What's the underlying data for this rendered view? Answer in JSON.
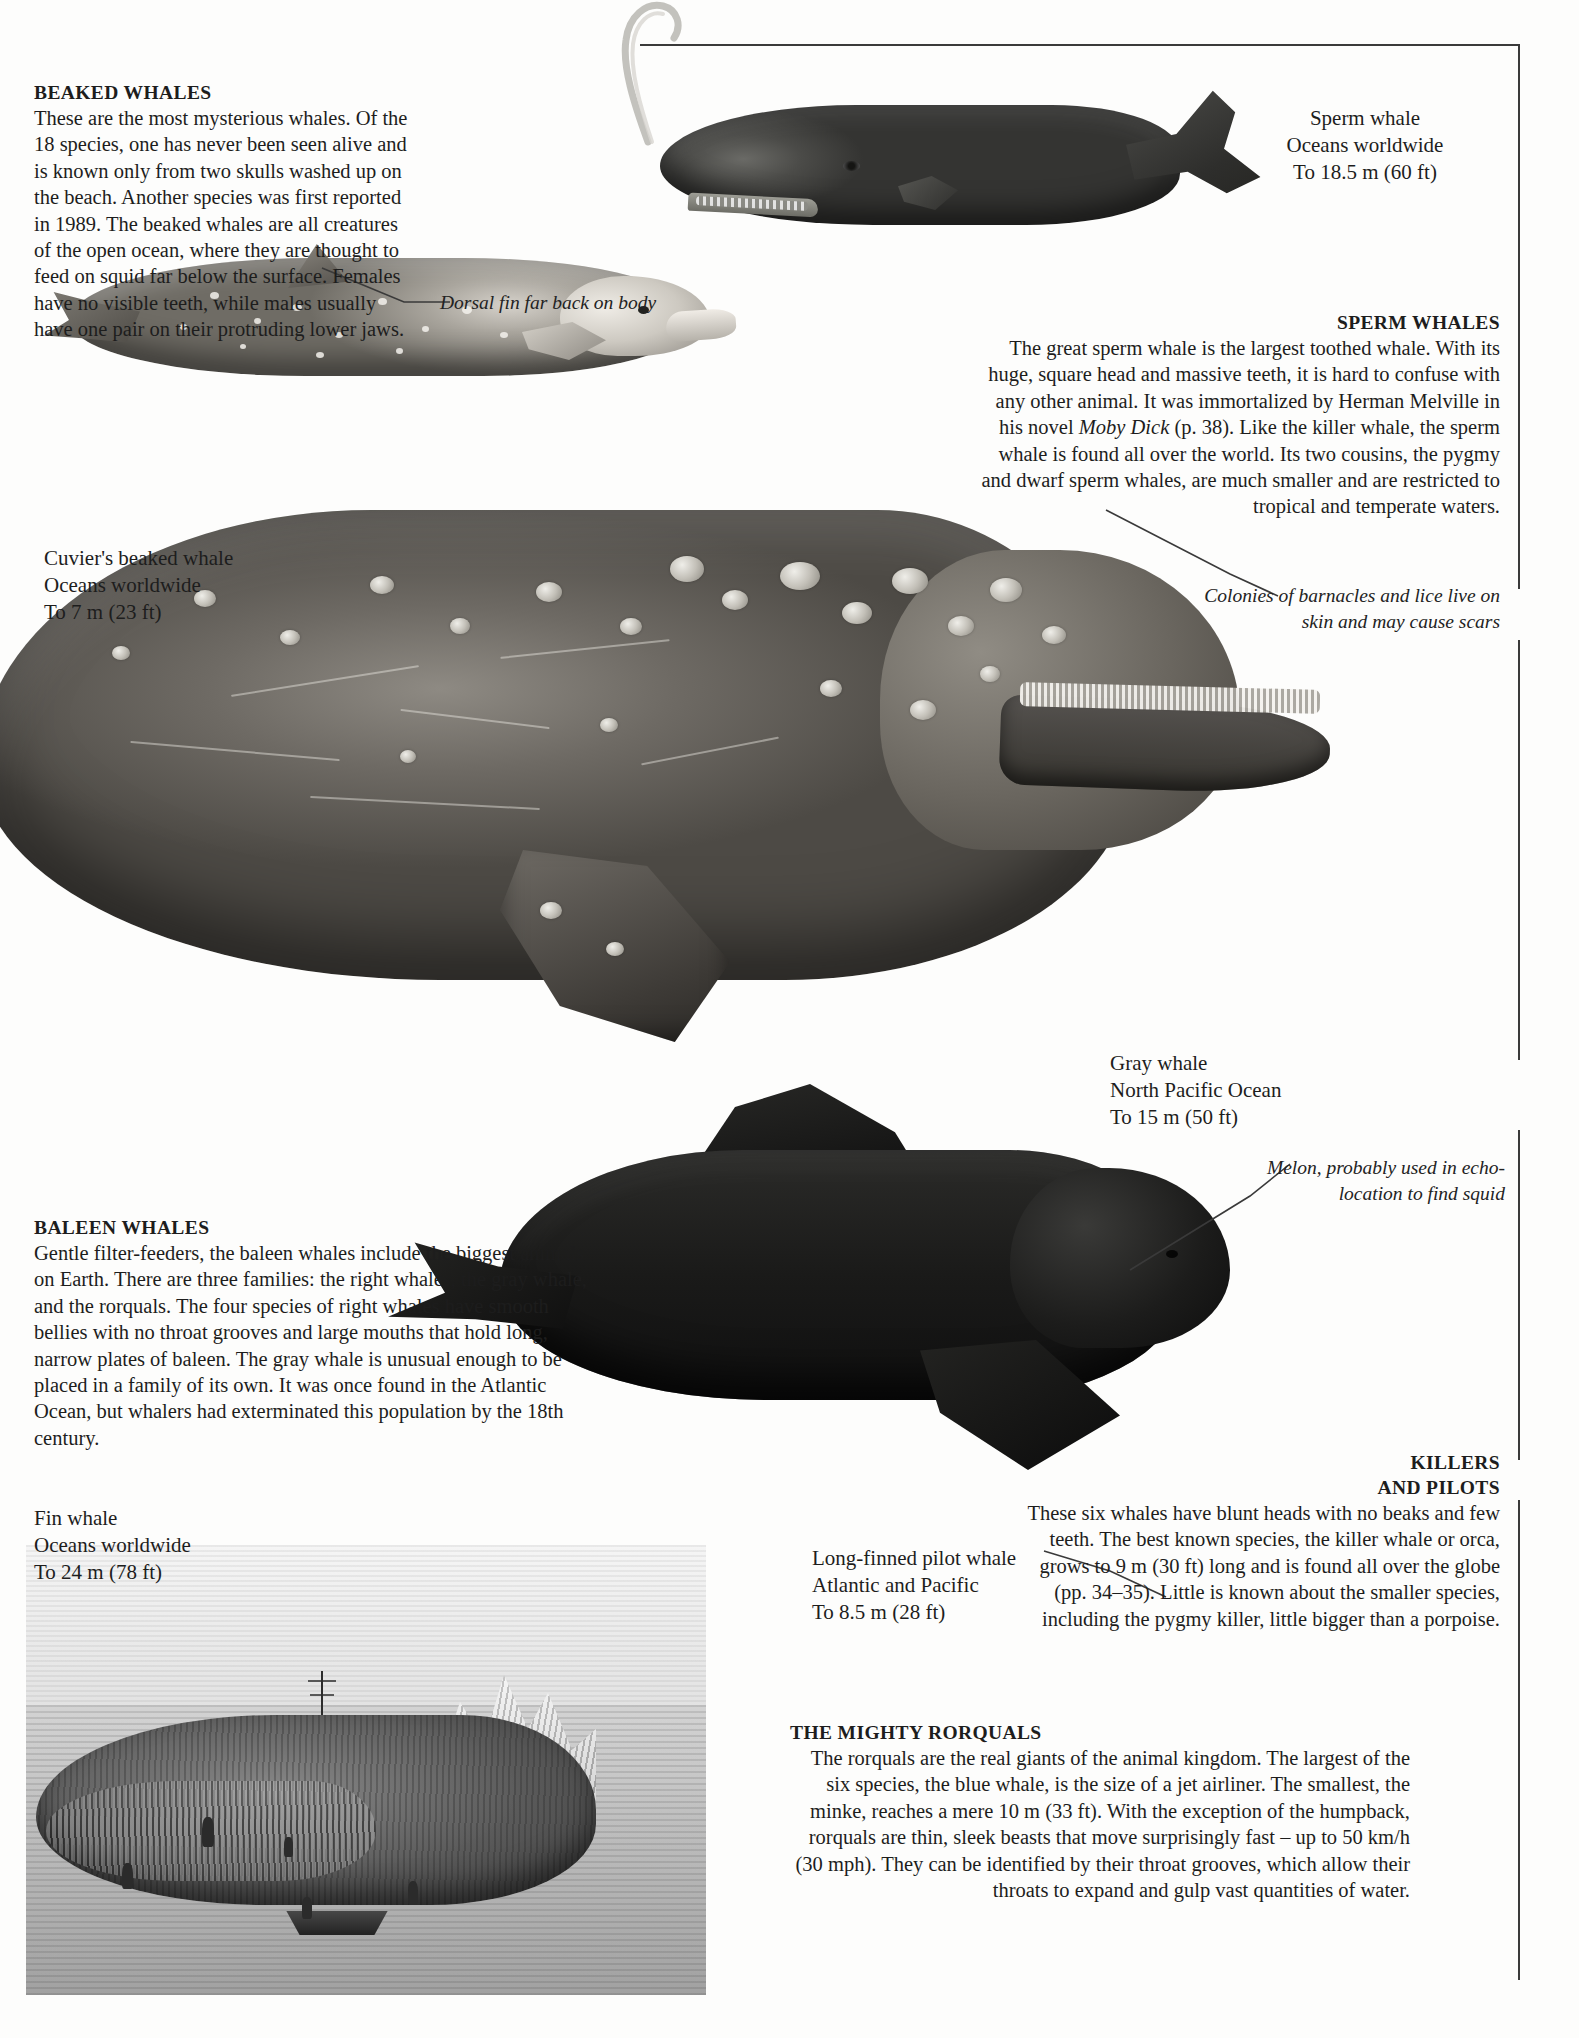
{
  "sections": {
    "beaked": {
      "heading": "BEAKED WHALES",
      "body": "These are the most mysterious whales. Of the 18 species, one has never been seen alive and is known only from two skulls washed up on the beach. Another species was first reported in 1989. The beaked whales are all creatures of the open ocean, where they are thought to feed on squid far below the surface. Females have no visible teeth, while males usually have one pair on their protruding lower jaws."
    },
    "sperm": {
      "heading": "SPERM WHALES",
      "body_1": "The great sperm whale is the largest toothed whale. With its huge, square head and massive teeth, it is hard to confuse with any other animal. It was immortalized by Herman Melville in his novel ",
      "book_title": "Moby Dick",
      "body_2": " (p. 38). Like the killer whale, the sperm whale is found all over the world. Its two cousins, the pygmy and dwarf sperm whales, are much smaller and are restricted to tropical and temperate waters."
    },
    "baleen": {
      "heading": "BALEEN WHALES",
      "body": "Gentle filter-feeders, the baleen whales include the biggest animals on Earth. There are three families: the right whales, the gray whale, and the rorquals. The four species of right whales have smooth bellies with no throat grooves and large mouths that hold long, narrow plates of baleen. The gray whale is unusual enough to be placed in a family of its own. It was once found in the Atlantic Ocean, but whalers had exterminated this population by the 18th century."
    },
    "killers": {
      "heading_line_1": "KILLERS",
      "heading_line_2": "AND PILOTS",
      "body": "These six whales have blunt heads with no beaks and few teeth. The best known species, the killer whale or orca, grows to 9 m (30 ft) long and is found all over the globe (pp. 34–35). Little is known about the smaller species, including the pygmy killer, little bigger than a porpoise."
    },
    "rorquals": {
      "heading": "THE MIGHTY RORQUALS",
      "body": "The rorquals are the real giants of the animal kingdom. The largest of the six species, the blue whale, is the size of a jet airliner. The smallest, the minke, reaches a mere 10 m (33 ft). With the exception of the humpback, rorquals are thin, sleek beasts that move surprisingly fast – up to 50 km/h (30 mph). They can be identified by their throat grooves, which allow their throats to expand and gulp vast quantities of water."
    }
  },
  "captions": {
    "sperm_whale": {
      "name": "Sperm whale",
      "range": "Oceans worldwide",
      "size": "To 18.5 m (60 ft)"
    },
    "cuviers_beaked_whale": {
      "name": "Cuvier's beaked whale",
      "range": "Oceans worldwide",
      "size": "To 7 m (23 ft)"
    },
    "gray_whale": {
      "name": "Gray whale",
      "range": "North Pacific Ocean",
      "size": "To 15 m (50 ft)"
    },
    "pilot_whale": {
      "name": "Long-finned pilot whale",
      "range": "Atlantic and Pacific",
      "size": "To 8.5 m (28 ft)"
    },
    "fin_whale": {
      "name": "Fin whale",
      "range": "Oceans worldwide",
      "size": "To 24 m (78 ft)"
    }
  },
  "annotations": {
    "dorsal_fin": "Dorsal fin far back on body",
    "barnacles": "Colonies of barnacles and lice live on skin and may cause scars",
    "melon": "Melon, probably used in echo-location to find squid"
  },
  "colors": {
    "ink": "#1d1d1d",
    "rule": "#3a3a3a",
    "paper": "#fdfdfc"
  }
}
